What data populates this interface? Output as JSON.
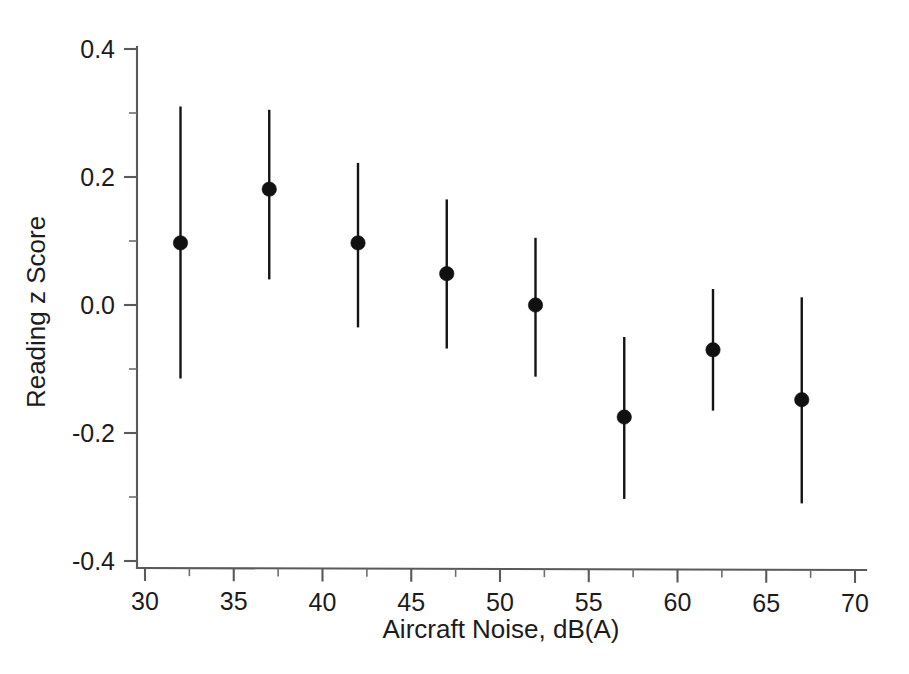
{
  "chart_data": {
    "type": "scatter",
    "title": "",
    "xlabel": "Aircraft Noise, dB(A)",
    "ylabel": "Reading z Score",
    "xlim": [
      30,
      70
    ],
    "ylim": [
      -0.4,
      0.4
    ],
    "xticks": [
      30,
      35,
      40,
      45,
      50,
      55,
      60,
      65,
      70
    ],
    "xticklabels": [
      "30",
      "35",
      "40",
      "45",
      "50",
      "55",
      "60",
      "65",
      "70"
    ],
    "yticks": [
      -0.4,
      -0.2,
      0.0,
      0.2,
      0.4
    ],
    "yticklabels": [
      "-0.4",
      "-0.2",
      "0.0",
      "0.2",
      "0.4"
    ],
    "x_minor_ticks": [
      32.5,
      37.5,
      42.5,
      47.5,
      52.5,
      57.5,
      62.5,
      67.5
    ],
    "y_minor_ticks": [
      -0.3,
      -0.1,
      0.1,
      0.3
    ],
    "grid": false,
    "legend": null,
    "marker": "filled-circle",
    "errorbar_style": "vertical-line-no-caps",
    "x": [
      32,
      37,
      42,
      47,
      52,
      57,
      62,
      67
    ],
    "values": [
      0.097,
      0.181,
      0.097,
      0.049,
      0.0,
      -0.175,
      -0.07,
      -0.148
    ],
    "y_upper": [
      0.31,
      0.305,
      0.222,
      0.165,
      0.105,
      -0.05,
      0.025,
      0.012
    ],
    "y_lower": [
      -0.115,
      0.04,
      -0.035,
      -0.068,
      -0.112,
      -0.303,
      -0.165,
      -0.31
    ],
    "points": [
      {
        "x": 32,
        "y": 0.097,
        "low": -0.115,
        "high": 0.31
      },
      {
        "x": 37,
        "y": 0.181,
        "low": 0.04,
        "high": 0.305
      },
      {
        "x": 42,
        "y": 0.097,
        "low": -0.035,
        "high": 0.222
      },
      {
        "x": 47,
        "y": 0.049,
        "low": -0.068,
        "high": 0.165
      },
      {
        "x": 52,
        "y": 0.0,
        "low": -0.112,
        "high": 0.105
      },
      {
        "x": 57,
        "y": -0.175,
        "low": -0.303,
        "high": -0.05
      },
      {
        "x": 62,
        "y": -0.07,
        "low": -0.165,
        "high": 0.025
      },
      {
        "x": 67,
        "y": -0.148,
        "low": -0.31,
        "high": 0.012
      }
    ],
    "colors": {
      "marker": "#111111",
      "errorbar": "#141414",
      "axis": "#5a5a5a",
      "text": "#1c1c1c",
      "background": "#ffffff"
    }
  }
}
